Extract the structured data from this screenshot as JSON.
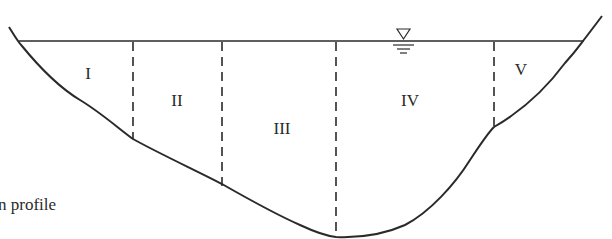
{
  "diagram": {
    "type": "channel-cross-section-subdivision",
    "caption_fragment": "n profile",
    "water_surface_symbol": "water-level-triangle",
    "subsections": [
      {
        "id": "I",
        "label": "I"
      },
      {
        "id": "II",
        "label": "II"
      },
      {
        "id": "III",
        "label": "III"
      },
      {
        "id": "IV",
        "label": "IV"
      },
      {
        "id": "V",
        "label": "V"
      }
    ],
    "divider_count": 4,
    "colors": {
      "line": "#2a2a2a",
      "background": "#ffffff"
    }
  }
}
